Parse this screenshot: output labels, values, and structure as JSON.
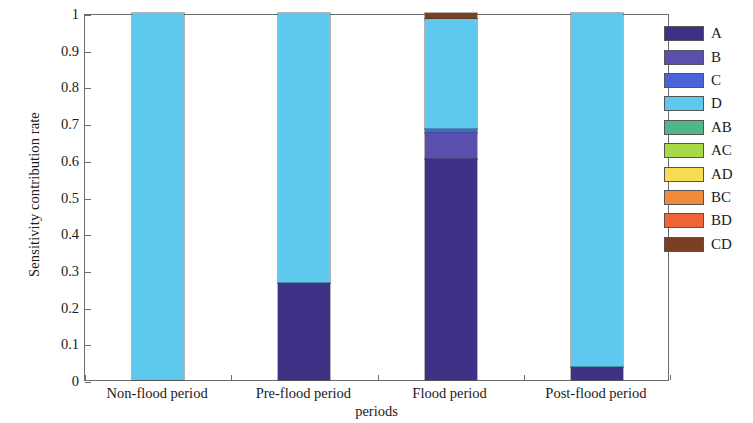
{
  "chart_data": {
    "type": "bar",
    "stacked": true,
    "title": "",
    "xlabel": "periods",
    "ylabel": "Sensitivity contribution rate",
    "ylim": [
      0,
      1
    ],
    "yticks": [
      "0",
      "0.1",
      "0.2",
      "0.3",
      "0.4",
      "0.5",
      "0.6",
      "0.7",
      "0.8",
      "0.9",
      "1"
    ],
    "ytick_values": [
      0,
      0.1,
      0.2,
      0.3,
      0.4,
      0.5,
      0.6,
      0.7,
      0.8,
      0.9,
      1
    ],
    "grid": false,
    "legend_position": "right",
    "categories": [
      "Non-flood period",
      "Pre-flood period",
      "Flood period",
      "Post-flood period"
    ],
    "series": [
      {
        "name": "A",
        "color": "#3c3184",
        "values": [
          0.0,
          0.263,
          0.602,
          0.035
        ]
      },
      {
        "name": "B",
        "color": "#5b4fae",
        "values": [
          0.0,
          0.0,
          0.072,
          0.0
        ]
      },
      {
        "name": "C",
        "color": "#4a63d8",
        "values": [
          0.0,
          0.0,
          0.01,
          0.0
        ]
      },
      {
        "name": "D",
        "color": "#5fc8ef",
        "values": [
          1.0,
          0.737,
          0.3,
          0.965
        ]
      },
      {
        "name": "AB",
        "color": "#4fb787",
        "values": [
          0.0,
          0.0,
          0.0,
          0.0
        ]
      },
      {
        "name": "AC",
        "color": "#a8d94a",
        "values": [
          0.0,
          0.0,
          0.0,
          0.0
        ]
      },
      {
        "name": "AD",
        "color": "#f6dd55",
        "values": [
          0.0,
          0.0,
          0.0,
          0.0
        ]
      },
      {
        "name": "BC",
        "color": "#f08a3c",
        "values": [
          0.0,
          0.0,
          0.0,
          0.0
        ]
      },
      {
        "name": "BD",
        "color": "#ec6437",
        "values": [
          0.0,
          0.0,
          0.0,
          0.0
        ]
      },
      {
        "name": "CD",
        "color": "#7b3f21",
        "values": [
          0.0,
          0.0,
          0.016,
          0.0
        ]
      }
    ]
  },
  "legend": {
    "items": [
      {
        "label": "A",
        "color": "#3c3184"
      },
      {
        "label": "B",
        "color": "#5b4fae"
      },
      {
        "label": "C",
        "color": "#4a63d8"
      },
      {
        "label": "D",
        "color": "#5fc8ef"
      },
      {
        "label": "AB",
        "color": "#4fb787"
      },
      {
        "label": "AC",
        "color": "#a8d94a"
      },
      {
        "label": "AD",
        "color": "#f6dd55"
      },
      {
        "label": "BC",
        "color": "#f08a3c"
      },
      {
        "label": "BD",
        "color": "#ec6437"
      },
      {
        "label": "CD",
        "color": "#7b3f21"
      }
    ]
  },
  "axis": {
    "y_title": "Sensitivity contribution rate",
    "x_title": "periods"
  }
}
